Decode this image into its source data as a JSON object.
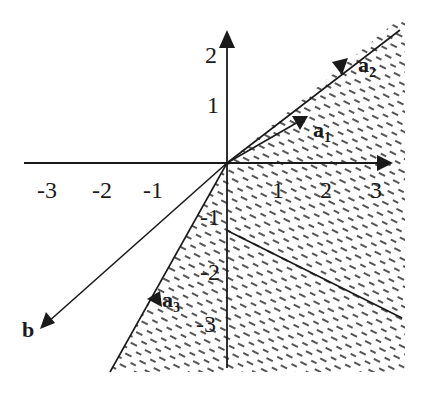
{
  "figure": {
    "type": "cone-diagram",
    "axes": {
      "x_ticks": [
        "-3",
        "-2",
        "-1",
        "1",
        "2",
        "3"
      ],
      "y_ticks": [
        "2",
        "1",
        "-1",
        "-2",
        "-3"
      ]
    },
    "vectors": {
      "a1": {
        "label": "a",
        "sub": "1"
      },
      "a2": {
        "label": "a",
        "sub": "2"
      },
      "a3": {
        "label": "a",
        "sub": "3"
      },
      "b": {
        "label": "b"
      }
    },
    "colors": {
      "ink": "#1a1a1a",
      "hatch": "#2a2a2a",
      "background": "#ffffff"
    }
  }
}
